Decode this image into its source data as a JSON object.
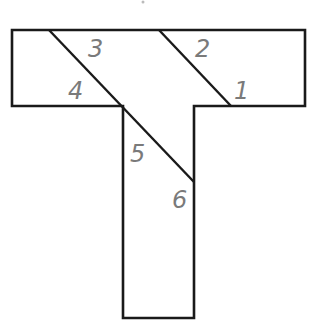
{
  "diagram": {
    "outline_color": "#1a1a1a",
    "label_color": "#7a7a7a",
    "labels": [
      {
        "id": "1",
        "text": "1",
        "x": 234,
        "y": 99
      },
      {
        "id": "2",
        "text": "2",
        "x": 195,
        "y": 57
      },
      {
        "id": "3",
        "text": "3",
        "x": 88,
        "y": 57
      },
      {
        "id": "4",
        "text": "4",
        "x": 68,
        "y": 99
      },
      {
        "id": "5",
        "text": "5",
        "x": 130,
        "y": 162
      },
      {
        "id": "6",
        "text": "6",
        "x": 172,
        "y": 208
      }
    ]
  }
}
